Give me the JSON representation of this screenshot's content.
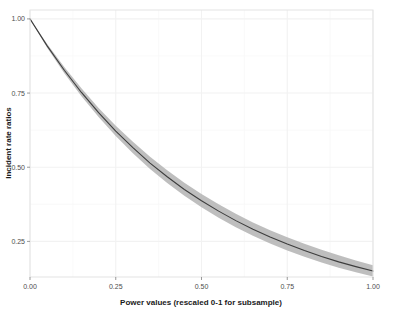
{
  "chart_data": {
    "type": "line",
    "title": "",
    "xlabel": "Power values (rescaled 0-1 for subsample)",
    "ylabel": "Incident rate ratios",
    "xlim": [
      0,
      1
    ],
    "ylim": [
      0.13,
      1.03
    ],
    "grid": true,
    "legend": "none",
    "xticks": [
      "0.00",
      "0.25",
      "0.50",
      "0.75",
      "1.00"
    ],
    "xtick_values": [
      0,
      0.25,
      0.5,
      0.75,
      1
    ],
    "yticks": [
      "0.25",
      "0.50",
      "0.75",
      "1.00"
    ],
    "ytick_values": [
      0.25,
      0.5,
      0.75,
      1
    ],
    "series": [
      {
        "name": "Incident rate ratio",
        "kind": "line",
        "color": "#3d3d3d",
        "x": [
          0,
          0.05,
          0.1,
          0.15,
          0.2,
          0.25,
          0.3,
          0.35,
          0.4,
          0.45,
          0.5,
          0.55,
          0.6,
          0.65,
          0.7,
          0.75,
          0.8,
          0.85,
          0.9,
          0.95,
          1
        ],
        "values": [
          1.0,
          0.909,
          0.827,
          0.752,
          0.684,
          0.622,
          0.566,
          0.514,
          0.468,
          0.425,
          0.387,
          0.352,
          0.32,
          0.291,
          0.265,
          0.241,
          0.219,
          0.199,
          0.181,
          0.165,
          0.15
        ]
      },
      {
        "name": "95% confidence interval",
        "kind": "ribbon",
        "color": "#b3b3b3",
        "x": [
          0,
          0.05,
          0.1,
          0.15,
          0.2,
          0.25,
          0.3,
          0.35,
          0.4,
          0.45,
          0.5,
          0.55,
          0.6,
          0.65,
          0.7,
          0.75,
          0.8,
          0.85,
          0.9,
          0.95,
          1
        ],
        "lower": [
          1.0,
          0.903,
          0.817,
          0.739,
          0.669,
          0.605,
          0.547,
          0.494,
          0.447,
          0.404,
          0.365,
          0.33,
          0.298,
          0.269,
          0.243,
          0.219,
          0.198,
          0.179,
          0.161,
          0.146,
          0.132
        ],
        "upper": [
          1.0,
          0.915,
          0.838,
          0.766,
          0.7,
          0.64,
          0.586,
          0.535,
          0.49,
          0.448,
          0.41,
          0.375,
          0.343,
          0.314,
          0.288,
          0.264,
          0.242,
          0.222,
          0.203,
          0.186,
          0.17
        ]
      }
    ]
  },
  "panel": {
    "background": "#ffffff",
    "border_color": "#e3e3e3",
    "gridline_color": "#f7f7f7"
  }
}
